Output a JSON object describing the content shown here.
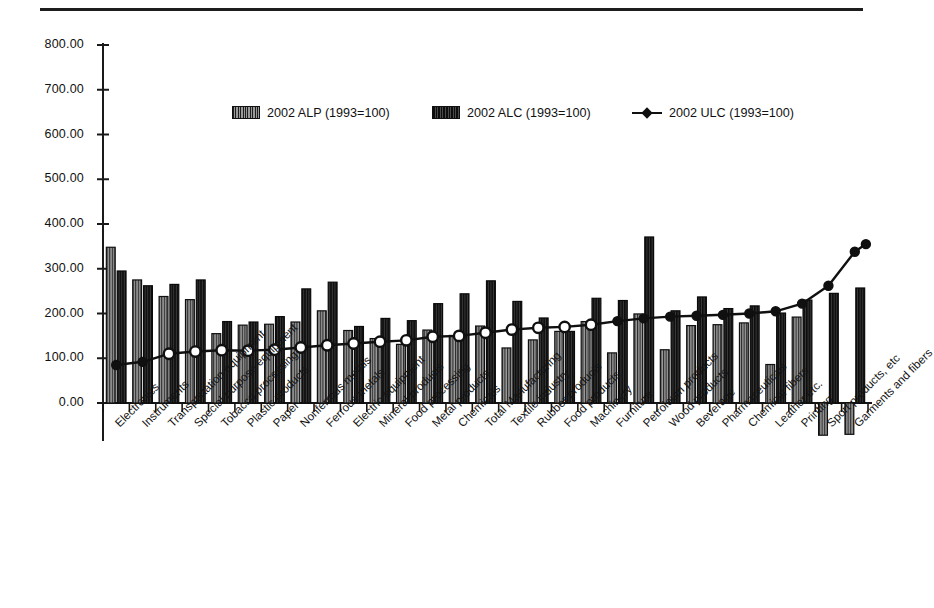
{
  "figure": {
    "background": "#ffffff",
    "top_rule_color": "#1d1d1d"
  },
  "legend": {
    "position": "top-center",
    "items": [
      {
        "label": "2002 ALP (1993=100)",
        "marker": "filled-square-hatched",
        "color": "#8c8c8c"
      },
      {
        "label": "2002 ALC (1993=100)",
        "marker": "filled-square-dark",
        "color": "#2b2b2b"
      },
      {
        "label": "2002 ULC (1993=100)",
        "marker": "line-with-diamond",
        "color": "#101010"
      }
    ]
  },
  "axis": {
    "y_ticks": [
      "0.00",
      "100.00",
      "200.00",
      "300.00",
      "400.00",
      "500.00",
      "600.00",
      "700.00",
      "800.00"
    ],
    "y_min": 0,
    "y_max": 800,
    "y_step": 100,
    "grid": false
  },
  "chart_data": {
    "type": "bar",
    "title": "",
    "subtitle": "",
    "xlabel": "",
    "ylabel": "",
    "ylim": [
      0,
      800
    ],
    "yticks": [
      0,
      100,
      200,
      300,
      400,
      500,
      600,
      700,
      800
    ],
    "grid": false,
    "legend_position": "top-center",
    "categories": [
      "Electronics",
      "Instruments",
      "Transportation equipment",
      "Special purpose equipment",
      "Tobacco processing",
      "Plastic products",
      "Paper",
      "Nonferrous metals",
      "Ferrous metals",
      "Electric equipment",
      "Mineral products",
      "Food processing",
      "Metal products",
      "Chemicals",
      "Total Manufacturing",
      "Textile industry",
      "Rubber products",
      "Food products",
      "Machinery",
      "Furniture",
      "Petroleum products",
      "Wood products",
      "Beverage",
      "Pharmaceuticals",
      "Chemical fibers",
      "Leather etc.",
      "Printing",
      "Sport products, etc",
      "Garments and fibers"
    ],
    "series": [
      {
        "name": "2002 ALP (1993=100)",
        "type": "bar",
        "color": "#8c8c8c",
        "values": [
          348,
          275,
          238,
          231,
          155,
          174,
          176,
          181,
          206,
          162,
          144,
          131,
          163,
          151,
          172,
          123,
          141,
          160,
          182,
          112,
          199,
          119,
          173,
          175,
          179,
          86,
          192,
          -72,
          -70
        ]
      },
      {
        "name": "2002 ALC (1993=100)",
        "type": "bar",
        "color": "#2b2b2b",
        "values": [
          295,
          262,
          265,
          275,
          182,
          181,
          193,
          255,
          270,
          171,
          189,
          184,
          222,
          244,
          273,
          227,
          190,
          160,
          234,
          229,
          371,
          206,
          237,
          211,
          217,
          201,
          230,
          245,
          257
        ]
      },
      {
        "name": "2002 ULC (1993=100)",
        "type": "line",
        "color": "#101010",
        "marker": "circle",
        "values": [
          85,
          92,
          110,
          115,
          118,
          117,
          119,
          124,
          129,
          133,
          137,
          140,
          148,
          150,
          157,
          164,
          168,
          170,
          175,
          183,
          189,
          193,
          195,
          197,
          200,
          205,
          222,
          262,
          338
        ]
      }
    ],
    "note": "ULC line terminates at 355 beyond last category marker"
  },
  "ulc_line_extra_point": 355
}
